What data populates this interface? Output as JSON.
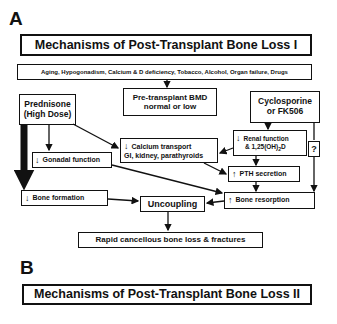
{
  "panel_a": {
    "label": "A",
    "title": "Mechanisms of Post-Transplant Bone Loss I",
    "risk_factors": "Aging, Hypogonadism, Calcium & D deficiency, Tobacco, Alcohol, Organ failure, Drugs",
    "pretransplant_bmd": {
      "line1": "Pre-transplant BMD",
      "line2": "normal or low"
    },
    "prednisone": {
      "line1": "Prednisone",
      "line2": "(High Dose)"
    },
    "cyclosporine": {
      "line1": "Cyclosporine",
      "line2": "or FK506"
    },
    "gonadal": "Gonadal function",
    "calcium": {
      "line1": "Calcium transport",
      "line2": "GI, kidney, parathyroids"
    },
    "renal": {
      "line1": "Renal function",
      "line2_pre": "& 1,25(OH)",
      "line2_sub": "2",
      "line2_post": "D"
    },
    "question": "?",
    "pth": "PTH secretion",
    "bone_formation": "Bone formation",
    "uncoupling": "Uncoupling",
    "bone_resorption": "Bone resorption",
    "outcome": "Rapid cancellous bone loss & fractures",
    "symbols": {
      "decrease": "↓",
      "increase": "↑"
    }
  },
  "panel_b": {
    "label": "B",
    "title": "Mechanisms of Post-Transplant Bone Loss II"
  }
}
